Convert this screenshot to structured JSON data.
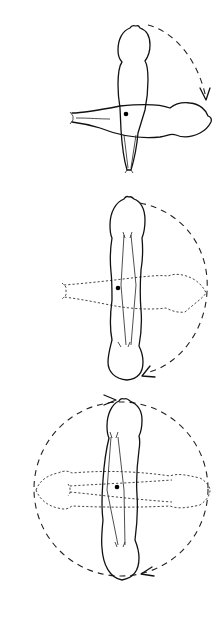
{
  "figure": {
    "panels": [
      {
        "id": 1,
        "label": "",
        "rotation_shown": "quarter turn (clockwise)"
      },
      {
        "id": 2,
        "label": "",
        "rotation_shown": "half turn (clockwise)"
      },
      {
        "id": 3,
        "label": "",
        "rotation_shown": "full turn (both directions)"
      }
    ],
    "colors": {
      "line": "#111111",
      "background": "#ffffff"
    }
  }
}
